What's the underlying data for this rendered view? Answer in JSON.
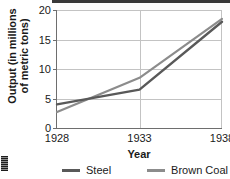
{
  "chart_data": {
    "type": "line",
    "title": "",
    "xlabel": "Year",
    "ylabel": "Output (in millions of metric tons)",
    "ylabel_line1": "Output (in millions",
    "ylabel_line2": "of metric tons)",
    "x": [
      1928,
      1933,
      1938
    ],
    "xtick_labels": [
      "1928",
      "1933",
      "1938"
    ],
    "ytick_labels": [
      "0",
      "5",
      "10",
      "15",
      "20"
    ],
    "yticks": [
      0,
      5,
      10,
      15,
      20
    ],
    "ylim": [
      0,
      20
    ],
    "xlim": [
      1928,
      1938
    ],
    "grid": true,
    "legend_position": "bottom",
    "series": [
      {
        "name": "Steel",
        "values": [
          4.0,
          6.5,
          18.0
        ],
        "color": "#595959"
      },
      {
        "name": "Brown Coal",
        "values": [
          2.7,
          8.5,
          18.5
        ],
        "color": "#8c8c8c"
      }
    ]
  },
  "legend": {
    "steel_label": "Steel",
    "browncoal_label": "Brown Coal"
  },
  "axes": {
    "x_title": "Year",
    "y_title_line1": "Output (in millions",
    "y_title_line2": "of metric tons)",
    "y_0": "0",
    "y_5": "5",
    "y_10": "10",
    "y_15": "15",
    "y_20": "20",
    "x_1928": "1928",
    "x_1933": "1933",
    "x_1938": "1938"
  },
  "colors": {
    "steel": "#595959",
    "brown_coal": "#8c8c8c",
    "grid": "#c3c3c3",
    "axis": "#6e6e6e",
    "text": "#1a1a1a"
  }
}
